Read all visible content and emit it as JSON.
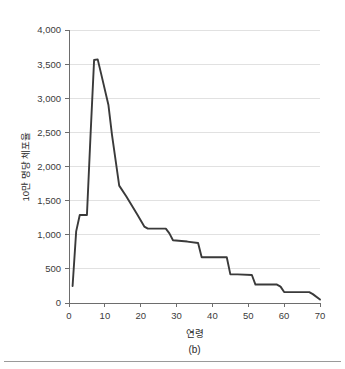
{
  "figure": {
    "caption": "(b)",
    "background_color": "#ffffff",
    "line_color": "#3a3a3a",
    "grid_color": "#d9d9d9",
    "axis_color": "#6d6d6d"
  },
  "chart_data": {
    "type": "line",
    "title": "",
    "xlabel": "연령",
    "ylabel": "10만 명당 체포율",
    "xlim": [
      0,
      70
    ],
    "ylim": [
      0,
      4000
    ],
    "xticks": [
      0,
      10,
      20,
      30,
      40,
      50,
      60,
      70
    ],
    "xtick_labels": [
      "0",
      "10",
      "20",
      "30",
      "40",
      "50",
      "60",
      "70"
    ],
    "yticks": [
      0,
      500,
      1000,
      1500,
      2000,
      2500,
      3000,
      3500,
      4000
    ],
    "ytick_labels": [
      "0",
      "500",
      "1,000",
      "1,500",
      "2,000",
      "2,500",
      "3,000",
      "3,500",
      "4,000"
    ],
    "grid": true,
    "grid_axis": "y",
    "legend": false,
    "series": [
      {
        "name": "10만 명당 체포율",
        "color": "#3a3a3a",
        "x": [
          1,
          2,
          3,
          5,
          6,
          7,
          8,
          9,
          11,
          12,
          14,
          16,
          19,
          21,
          22,
          27,
          28,
          29,
          33,
          36,
          37,
          44,
          45,
          47,
          51,
          52,
          58,
          59,
          60,
          67,
          68,
          70
        ],
        "values": [
          250,
          1050,
          1290,
          1290,
          2450,
          3560,
          3570,
          3350,
          2900,
          2460,
          1720,
          1560,
          1300,
          1120,
          1090,
          1090,
          1020,
          920,
          900,
          880,
          670,
          670,
          420,
          420,
          410,
          270,
          270,
          240,
          160,
          160,
          130,
          50
        ]
      }
    ]
  }
}
